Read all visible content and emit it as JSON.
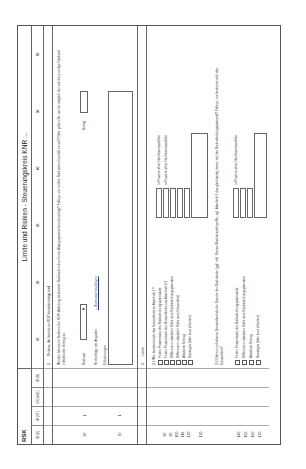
{
  "header": {
    "rsk": "RSK",
    "title": "Limite und Risiken - Steuerungskreis KNR ..."
  },
  "id_columns": [
    "ID (E)",
    "ID (VT)",
    "ID (UUE)",
    "ID (R)"
  ],
  "column_numbers": [
    "10",
    "20",
    "30",
    "40",
    "50",
    "60"
  ],
  "section2": {
    "number": "2.",
    "title": "Risiken, die bereits im RDP berücksichtigt sind",
    "intro": "Wurden bereits im Rahmen der RDP-Ableitung bestimmte Risikoarten durch eine Abzugsposition berücksichtigt? Falls ja, um welche Risikoarten handelt es sich? Bitte geben Sie soweit möglich den auf die jeweilige Risikoart entfallenden Betrag an.",
    "risikoart_label": "Risikoart",
    "risikoart_value": "",
    "betrag_label": "Betrag",
    "betrag_value": "",
    "reihenfolge_label": "Reihenfolge der Angaben",
    "add_link": "+ Datensatz hinzufügen",
    "erlaeuterungen_label": "Erläuterungen",
    "row_numbers": [
      {
        "a": "60",
        "b": "1"
      },
      {
        "a": "70",
        "b": "1"
      }
    ]
  },
  "section3": {
    "number": "3.",
    "title": "Limite",
    "q31": "3.1 Wie bestimmt sich das Gesamtlimit im Abschnitt 1?",
    "q31_options": [
      "Fester Prozentsatz des Risikodeckungspotenzials",
      "Fester Prozentsatz des Gesamtlimits aus Abschnitt 3.2",
      "Differenz in absoluter Höhe zum Risikodeckungspotenzial",
      "Differenz in absoluter Höhe zum Gesamtlimit",
      "Absoluter Betrag",
      "Sonstiges (bitte kurz erläutern)"
    ],
    "q31_side_labels": [
      "in Prozent ohne Nachkommastellen",
      "in Prozent ohne Nachkommastellen"
    ],
    "q32": "3.2 Gibt es ein höheres Gesamtlimit als die Summe der Risikolimite (ggf. inkl. Stress-/Risikotransferpuffer, vgl. Abschnitt 1 das gleichzeitig immer mit den Risikodeckungspotenzial? Falls ja, wie bestimmt sich das Gesamtlimit?",
    "q32_options": [
      "Fester Prozentsatz des Risikodeckungspotenzials",
      "Differenz in absoluter Höhe zum Risikodeckungspotenzial",
      "Absoluter Betrag",
      "Sonstiges (bitte kurz erläutern)"
    ],
    "q32_side_label": "in Prozent ohne Nachkommastellen",
    "row_numbers_31": [
      "80",
      "90",
      "100",
      "110",
      "120",
      "130"
    ],
    "row_numbers_32": [
      "140",
      "150",
      "160",
      "170"
    ]
  }
}
